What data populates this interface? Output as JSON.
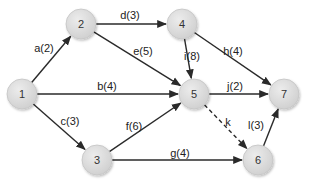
{
  "diagram": {
    "type": "activity-network",
    "nodes": [
      {
        "id": "1",
        "label": "1",
        "x": 22,
        "y": 94
      },
      {
        "id": "2",
        "label": "2",
        "x": 81,
        "y": 24
      },
      {
        "id": "3",
        "label": "3",
        "x": 97,
        "y": 160
      },
      {
        "id": "4",
        "label": "4",
        "x": 182,
        "y": 24
      },
      {
        "id": "5",
        "label": "5",
        "x": 194,
        "y": 94
      },
      {
        "id": "6",
        "label": "6",
        "x": 258,
        "y": 160
      },
      {
        "id": "7",
        "label": "7",
        "x": 284,
        "y": 94
      }
    ],
    "edges": [
      {
        "id": "a",
        "from": "1",
        "to": "2",
        "label": "a(2)",
        "dashed": false,
        "lx": 44,
        "ly": 52
      },
      {
        "id": "b",
        "from": "1",
        "to": "5",
        "label": "b(4)",
        "dashed": false,
        "lx": 107,
        "ly": 90
      },
      {
        "id": "c",
        "from": "1",
        "to": "3",
        "label": "c(3)",
        "dashed": false,
        "lx": 70,
        "ly": 125
      },
      {
        "id": "d",
        "from": "2",
        "to": "4",
        "label": "d(3)",
        "dashed": false,
        "lx": 130,
        "ly": 19
      },
      {
        "id": "e",
        "from": "2",
        "to": "5",
        "label": "e(5)",
        "dashed": false,
        "lx": 143,
        "ly": 55
      },
      {
        "id": "f",
        "from": "3",
        "to": "5",
        "label": "f(6)",
        "dashed": false,
        "lx": 134,
        "ly": 130
      },
      {
        "id": "g",
        "from": "3",
        "to": "6",
        "label": "g(4)",
        "dashed": false,
        "lx": 180,
        "ly": 157
      },
      {
        "id": "h",
        "from": "4",
        "to": "7",
        "label": "h(4)",
        "dashed": false,
        "lx": 233,
        "ly": 55
      },
      {
        "id": "i",
        "from": "4",
        "to": "5",
        "label": "i(8)",
        "dashed": false,
        "lx": 192,
        "ly": 60
      },
      {
        "id": "j",
        "from": "5",
        "to": "7",
        "label": "j(2)",
        "dashed": false,
        "lx": 235,
        "ly": 90
      },
      {
        "id": "k",
        "from": "5",
        "to": "6",
        "label": "k",
        "dashed": true,
        "lx": 228,
        "ly": 126
      },
      {
        "id": "l",
        "from": "6",
        "to": "7",
        "label": "l(3)",
        "dashed": false,
        "lx": 256,
        "ly": 129
      }
    ]
  },
  "colors": {
    "node_fill": "#dcdcdc",
    "node_stroke": "#c4c4c4",
    "edge": "#2a2a2a",
    "text": "#333333"
  }
}
